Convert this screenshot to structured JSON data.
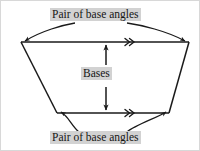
{
  "diagram": {
    "type": "geometry-trapezoid-annotated",
    "shape_name": "trapezoid",
    "labels": {
      "top_base_angles": "Pair of base angles",
      "bottom_base_angles": "Pair of base angles",
      "bases": "Bases"
    },
    "colors": {
      "label_background": "#d2d2d2",
      "label_text": "#151515",
      "stroke": "#1a1a1a",
      "page_background": "#ffffff",
      "frame_border": "#d8d8d8"
    },
    "shape": {
      "top_left": [
        20,
        41
      ],
      "top_right": [
        188,
        41
      ],
      "bottom_right": [
        168,
        112
      ],
      "bottom_left": [
        56,
        112
      ]
    },
    "parallel_marks": {
      "glyph": "double-chevron",
      "count": 2,
      "top_position": [
        128,
        41
      ],
      "bottom_position": [
        128,
        112
      ]
    },
    "bases_arrow": {
      "style": "double-headed-vertical",
      "x": 105,
      "y_top": 41,
      "y_bottom": 112
    },
    "angle_pointers": [
      {
        "name": "top-left-angle-pointer",
        "target": [
          20,
          41
        ]
      },
      {
        "name": "top-right-angle-pointer",
        "target": [
          188,
          41
        ]
      },
      {
        "name": "bottom-left-angle-pointer",
        "target": [
          56,
          112
        ]
      },
      {
        "name": "bottom-right-angle-pointer",
        "target": [
          168,
          112
        ]
      }
    ]
  }
}
